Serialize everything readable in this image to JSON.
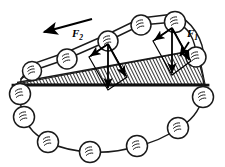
{
  "figure": {
    "type": "physics-diagram",
    "width": 225,
    "height": 167,
    "background_color": "#ffffff",
    "ink_color": "#1a1a1a"
  },
  "labels": {
    "force_1": {
      "base": "F",
      "subscript": "1",
      "x": 190,
      "y": 38
    },
    "force_2": {
      "base": "F",
      "subscript": "2",
      "x": 79,
      "y": 36
    }
  },
  "wedge": {
    "name": "inclined-wedge",
    "fill": "hatched",
    "hatch_color": "#111111",
    "hatch_angle_deg": -26,
    "hatch_spacing_px": 3,
    "vertices": [
      {
        "x": 16,
        "y": 84
      },
      {
        "x": 205,
        "y": 84
      },
      {
        "x": 198,
        "y": 50
      }
    ],
    "base_line": {
      "x1": 14,
      "y1": 85,
      "x2": 207,
      "y2": 85,
      "width": 2.6
    },
    "incline_line": {
      "x1": 17,
      "y1": 83,
      "x2": 199,
      "y2": 49
    }
  },
  "motion_arrow": {
    "name": "direction-of-motion-arrow",
    "from": {
      "x": 92,
      "y": 20
    },
    "to": {
      "x": 42,
      "y": 33
    },
    "head_length": 9,
    "description": "arrow indicating chain travels up-left along incline"
  },
  "balls": {
    "radius": 9.5,
    "outline_color": "#1a1a1a",
    "fill_color": "#ffffff",
    "count": 15,
    "positions": [
      {
        "id": "ball-incline-1",
        "x": 32,
        "y": 71,
        "r": 9.5
      },
      {
        "id": "ball-incline-2",
        "x": 67,
        "y": 59,
        "r": 10
      },
      {
        "id": "ball-incline-3",
        "x": 108,
        "y": 41,
        "r": 10
      },
      {
        "id": "ball-incline-4",
        "x": 141,
        "y": 25,
        "r": 10
      },
      {
        "id": "ball-incline-5",
        "x": 175,
        "y": 22,
        "r": 10.5
      },
      {
        "id": "ball-incline-6",
        "x": 196,
        "y": 57,
        "r": 10
      },
      {
        "id": "ball-chain-1",
        "x": 203,
        "y": 97,
        "r": 10.5
      },
      {
        "id": "ball-chain-2",
        "x": 178,
        "y": 128,
        "r": 10.5
      },
      {
        "id": "ball-chain-3",
        "x": 137,
        "y": 146,
        "r": 10.5
      },
      {
        "id": "ball-chain-4",
        "x": 90,
        "y": 152,
        "r": 10.5
      },
      {
        "id": "ball-chain-5",
        "x": 48,
        "y": 142,
        "r": 10.5
      },
      {
        "id": "ball-chain-6",
        "x": 24,
        "y": 117,
        "r": 10.5
      },
      {
        "id": "ball-chain-7",
        "x": 20,
        "y": 94,
        "r": 10.5
      }
    ]
  },
  "chain_path": {
    "name": "ball-chain-link-path",
    "stroke_width": 1.4,
    "description": "closed loop of links connecting all balls around wedge"
  },
  "vector_group_left": {
    "name": "force-decomposition-f2",
    "origin": {
      "x": 108,
      "y": 44
    },
    "vectors": [
      {
        "id": "weight-vector-left",
        "label": "W",
        "to": {
          "x": 108,
          "y": 90
        },
        "role": "vertical weight"
      },
      {
        "id": "normal-vector-left",
        "label": "N",
        "to": {
          "x": 89,
          "y": 56
        },
        "role": "perpendicular to incline"
      },
      {
        "id": "parallel-vector-left",
        "label": "F2",
        "to": {
          "x": 125,
          "y": 78
        },
        "role": "parallel to incline"
      }
    ]
  },
  "vector_group_right": {
    "name": "force-decomposition-f1",
    "origin": {
      "x": 172,
      "y": 28
    },
    "vectors": [
      {
        "id": "weight-vector-right",
        "label": "W",
        "to": {
          "x": 172,
          "y": 76
        },
        "role": "vertical weight"
      },
      {
        "id": "normal-vector-right",
        "label": "N",
        "to": {
          "x": 153,
          "y": 40
        },
        "role": "perpendicular to incline"
      },
      {
        "id": "parallel-vector-right",
        "label": "F1",
        "to": {
          "x": 189,
          "y": 62
        },
        "role": "parallel to incline"
      }
    ]
  }
}
